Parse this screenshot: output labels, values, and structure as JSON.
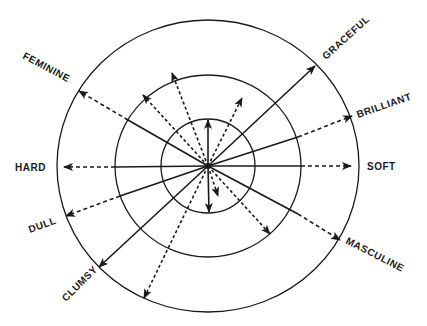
{
  "diagram": {
    "center": [
      208,
      166
    ],
    "rings": [
      {
        "name": "inner",
        "rx": 47,
        "ry": 47
      },
      {
        "name": "middle",
        "rx": 93,
        "ry": 91
      },
      {
        "name": "outer",
        "rx": 151,
        "ry": 146
      }
    ],
    "labeled_axes": [
      {
        "label": "GRACEFUL",
        "tip": [
          315,
          66
        ],
        "solid_to": [
          315,
          66
        ],
        "style": "solid",
        "text_pos": [
          326,
          60
        ],
        "rotate": -42
      },
      {
        "label": "BRILLIANT",
        "tip": [
          352,
          116
        ],
        "solid_to": [
          298,
          137
        ],
        "style": "solid-then-dashed",
        "text_pos": [
          358,
          118
        ],
        "rotate": -19
      },
      {
        "label": "SOFT",
        "tip": [
          351,
          166
        ],
        "solid_to": [
          301,
          166
        ],
        "style": "solid-then-dashed",
        "text_pos": [
          367,
          170
        ],
        "rotate": 0
      },
      {
        "label": "MASCULINE",
        "tip": [
          340,
          240
        ],
        "solid_to": [
          298,
          214
        ],
        "style": "solid-then-dashed",
        "text_pos": [
          345,
          243
        ],
        "rotate": 27
      },
      {
        "label": "CLUMSY",
        "tip": [
          99,
          267
        ],
        "solid_to": [
          99,
          267
        ],
        "style": "solid",
        "text_pos": [
          66,
          302
        ],
        "rotate": -45
      },
      {
        "label": "DULL",
        "tip": [
          66,
          216
        ],
        "solid_to": [
          120,
          196
        ],
        "style": "solid-then-dashed",
        "text_pos": [
          30,
          233
        ],
        "rotate": -20
      },
      {
        "label": "HARD",
        "tip": [
          64,
          167
        ],
        "solid_to": [
          115,
          167
        ],
        "style": "solid-then-dashed",
        "text_pos": [
          15,
          171
        ],
        "rotate": 0
      },
      {
        "label": "FEMININE",
        "tip": [
          79,
          91
        ],
        "solid_to": [
          128,
          120
        ],
        "style": "solid-then-dashed",
        "text_pos": [
          22,
          58
        ],
        "rotate": 28
      }
    ],
    "short_arrows": [
      {
        "tip": [
          208,
          120
        ],
        "style": "solid"
      },
      {
        "tip": [
          209,
          212
        ],
        "style": "solid"
      },
      {
        "tip": [
          218,
          196
        ],
        "style": "dotted"
      },
      {
        "tip": [
          242,
          98
        ],
        "style": "dotted"
      },
      {
        "tip": [
          172,
          73
        ],
        "style": "dotted"
      },
      {
        "tip": [
          143,
          95
        ],
        "style": "dotted"
      },
      {
        "tip": [
          144,
          298
        ],
        "style": "dotted"
      },
      {
        "tip": [
          270,
          234
        ],
        "style": "dotted"
      }
    ],
    "colors": {
      "ink": "#1a1a1a",
      "background": "#ffffff"
    }
  }
}
